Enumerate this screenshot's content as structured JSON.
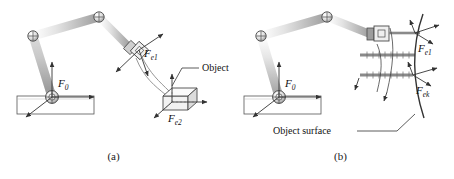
{
  "figure": {
    "background": "#ffffff",
    "ink": "#333333",
    "link_fill": "#d8d8d8",
    "panels": [
      {
        "id": "a",
        "caption": "(a)",
        "labels": {
          "base_frame": "F",
          "base_frame_sub": "0",
          "end_effector_frame": "F",
          "end_effector_frame_sub": "e1",
          "object_frame": "F",
          "object_frame_sub": "e2",
          "object_callout": "Object"
        }
      },
      {
        "id": "b",
        "caption": "(b)",
        "labels": {
          "base_frame": "F",
          "base_frame_sub": "0",
          "contact_frame_1": "F",
          "contact_frame_1_sub": "e1",
          "contact_frame_k": "F",
          "contact_frame_k_sub": "ek",
          "surface_callout": "Object surface"
        }
      }
    ]
  }
}
